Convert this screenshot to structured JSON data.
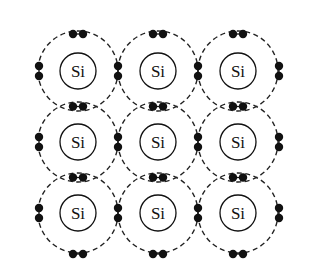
{
  "diagram": {
    "element_label": "Si",
    "grid": {
      "rows": 3,
      "cols": 3
    },
    "atom_centers_x": [
      78,
      158,
      238
    ],
    "atom_centers_y": [
      71,
      142,
      213
    ],
    "nucleus_radius": 18,
    "shell_radius": 40,
    "electron_radius": 4.2,
    "pair_spacing": 10,
    "atoms": [
      {
        "row": 0,
        "col": 0,
        "label": "Si"
      },
      {
        "row": 0,
        "col": 1,
        "label": "Si"
      },
      {
        "row": 0,
        "col": 2,
        "label": "Si"
      },
      {
        "row": 1,
        "col": 0,
        "label": "Si"
      },
      {
        "row": 1,
        "col": 1,
        "label": "Si"
      },
      {
        "row": 1,
        "col": 2,
        "label": "Si"
      },
      {
        "row": 2,
        "col": 0,
        "label": "Si"
      },
      {
        "row": 2,
        "col": 1,
        "label": "Si"
      },
      {
        "row": 2,
        "col": 2,
        "label": "Si"
      }
    ],
    "electrons_per_atom": 4,
    "bond_type": "covalent (shared electron pairs)",
    "colors": {
      "line": "#222222",
      "electron": "#111111",
      "background": "#ffffff"
    }
  }
}
